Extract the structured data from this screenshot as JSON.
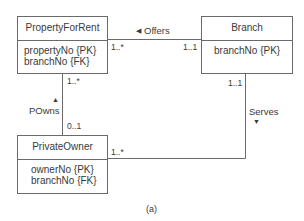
{
  "diagram": {
    "caption": "(a)",
    "colors": {
      "line": "#6a6a6a",
      "text": "#3a3a3a",
      "background": "#ffffff"
    },
    "classes": [
      {
        "id": "PropertyForRent",
        "name": "PropertyForRent",
        "attributes": [
          "propertyNo {PK}",
          "branchNo {FK}"
        ]
      },
      {
        "id": "Branch",
        "name": "Branch",
        "attributes": [
          "branchNo {PK}"
        ]
      },
      {
        "id": "PrivateOwner",
        "name": "PrivateOwner",
        "attributes": [
          "ownerNo {PK}",
          "branchNo {FK}"
        ]
      }
    ],
    "associations": [
      {
        "name": "Offers",
        "direction_icon": "triangle-left-icon",
        "direction_glyph": "◀",
        "from": "Branch",
        "to": "PropertyForRent",
        "mult_PropertyForRent": "1..*",
        "mult_Branch": "1..1"
      },
      {
        "name": "POwns",
        "direction_icon": "triangle-up-icon",
        "direction_glyph": "▲",
        "from": "PrivateOwner",
        "to": "PropertyForRent",
        "mult_PropertyForRent": "1..*",
        "mult_PrivateOwner": "0..1"
      },
      {
        "name": "Serves",
        "direction_icon": "triangle-down-icon",
        "direction_glyph": "▼",
        "from": "Branch",
        "to": "PrivateOwner",
        "mult_Branch": "1..1",
        "mult_PrivateOwner": "1..*"
      }
    ]
  }
}
